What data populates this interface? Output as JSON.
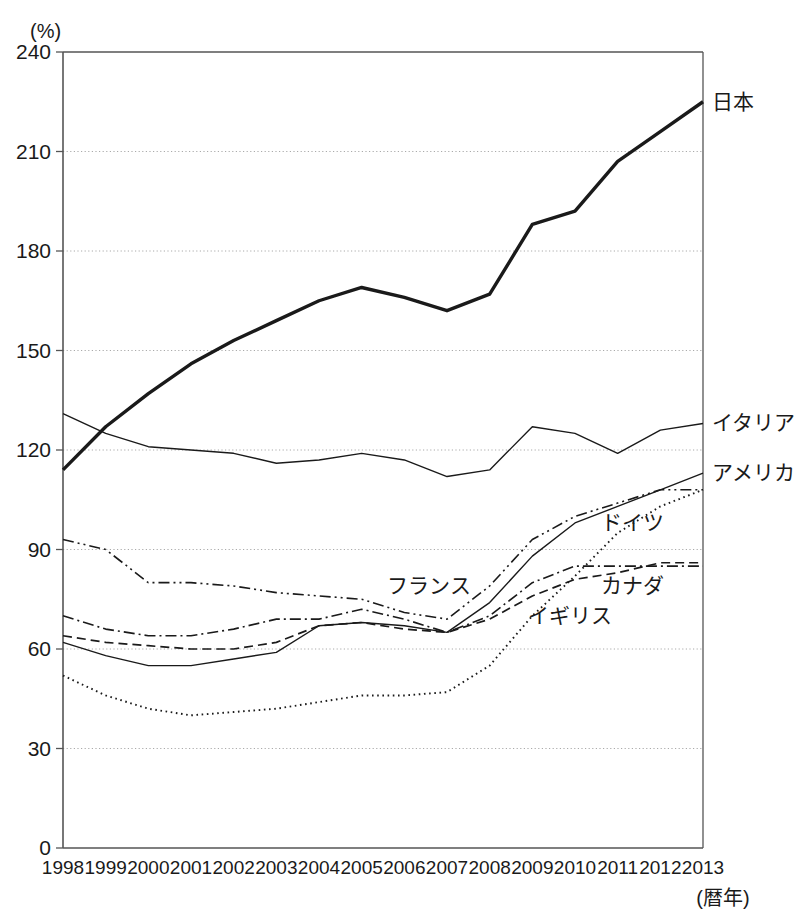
{
  "chart_data": {
    "type": "line",
    "title": "",
    "xlabel": "(暦年)",
    "ylabel": "(%)",
    "y_unit": "(%)",
    "grid": true,
    "legend_position": "inline-labels",
    "xlim": [
      1998,
      2013
    ],
    "ylim": [
      0,
      240
    ],
    "yticks": [
      0,
      30,
      60,
      90,
      120,
      150,
      180,
      210,
      240
    ],
    "x": [
      1998,
      1999,
      2000,
      2001,
      2002,
      2003,
      2004,
      2005,
      2006,
      2007,
      2008,
      2009,
      2010,
      2011,
      2012,
      2013
    ],
    "categories": [
      "1998",
      "1999",
      "2000",
      "2001",
      "2002",
      "2003",
      "2004",
      "2005",
      "2006",
      "2007",
      "2008",
      "2009",
      "2010",
      "2011",
      "2012",
      "2013"
    ],
    "series": [
      {
        "name": "日本",
        "label": "日本",
        "style": "solid-thick",
        "label_side": "right",
        "values": [
          114,
          127,
          137,
          146,
          153,
          159,
          165,
          169,
          166,
          162,
          167,
          188,
          192,
          207,
          216,
          225
        ]
      },
      {
        "name": "イタリア",
        "label": "イタリア",
        "style": "solid-thin",
        "label_side": "right",
        "values": [
          131,
          125,
          121,
          120,
          119,
          116,
          117,
          119,
          117,
          112,
          114,
          127,
          125,
          119,
          126,
          128
        ]
      },
      {
        "name": "アメリカ",
        "label": "アメリカ",
        "style": "solid-thin",
        "label_side": "right",
        "values": [
          62,
          58,
          55,
          55,
          57,
          59,
          67,
          68,
          67,
          65,
          74,
          88,
          98,
          103,
          108,
          113
        ]
      },
      {
        "name": "ドイツ",
        "label": "ドイツ",
        "style": "dash-dot",
        "label_side": "inline",
        "label_x": 2010.6,
        "label_y": 98,
        "values": [
          70,
          66,
          64,
          64,
          66,
          69,
          69,
          72,
          69,
          65,
          70,
          80,
          85,
          85,
          85,
          85
        ]
      },
      {
        "name": "フランス",
        "label": "フランス",
        "style": "dash-dot-dot",
        "label_side": "inline",
        "label_x": 2005.6,
        "label_y": 79,
        "values": [
          93,
          90,
          80,
          80,
          79,
          77,
          76,
          75,
          71,
          69,
          79,
          93,
          100,
          104,
          108,
          108
        ]
      },
      {
        "name": "カナダ",
        "label": "カナダ",
        "style": "dashed",
        "label_side": "inline",
        "label_x": 2010.6,
        "label_y": 79,
        "values": [
          64,
          62,
          61,
          60,
          60,
          62,
          67,
          68,
          66,
          65,
          69,
          76,
          81,
          83,
          86,
          86
        ]
      },
      {
        "name": "イギリス",
        "label": "イギリス",
        "style": "dotted",
        "label_side": "inline",
        "label_x": 2008.9,
        "label_y": 70,
        "values": [
          52,
          46,
          42,
          40,
          41,
          42,
          44,
          46,
          46,
          47,
          55,
          70,
          82,
          95,
          103,
          108
        ]
      }
    ]
  }
}
